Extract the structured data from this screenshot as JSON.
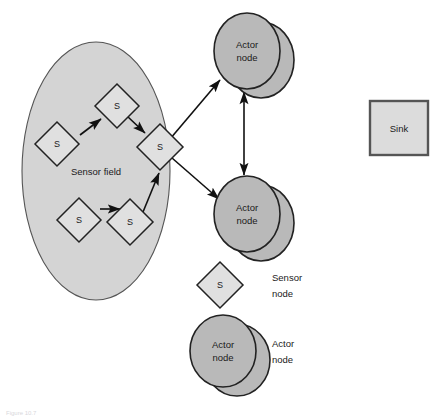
{
  "figure": {
    "caption": "Figure 10.7",
    "background_color": "#ffffff"
  },
  "colors": {
    "sensor_field_fill": "#d4d4d4",
    "sensor_field_stroke": "#555555",
    "actor_fill": "#b9b9b9",
    "actor_stroke": "#222222",
    "sensor_fill": "#e0e0e0",
    "sensor_stroke": "#222222",
    "sink_fill": "#dcdcdc",
    "sink_stroke": "#555555",
    "link_color": "#111111",
    "text_color": "#1a1a1a"
  },
  "sensor_field": {
    "label": "Sensor field",
    "label_x": 96,
    "label_y": 172,
    "cx": 96,
    "cy": 171,
    "rx": 74,
    "ry": 129
  },
  "sensor_nodes": [
    {
      "id": "s1",
      "label": "S",
      "x": 57,
      "y": 144,
      "half": 22
    },
    {
      "id": "s2",
      "label": "S",
      "x": 117,
      "y": 106,
      "half": 22
    },
    {
      "id": "s3",
      "label": "S",
      "x": 160,
      "y": 147,
      "half": 23
    },
    {
      "id": "s4",
      "label": "S",
      "x": 79,
      "y": 220,
      "half": 22
    },
    {
      "id": "s5",
      "label": "S",
      "x": 130,
      "y": 222,
      "half": 23
    }
  ],
  "actor_nodes": [
    {
      "id": "a1",
      "label_line1": "Actor",
      "label_line2": "node",
      "cx": 247,
      "cy": 51,
      "rx": 33,
      "ry": 38,
      "shadow_dx": 14,
      "shadow_dy": 9
    },
    {
      "id": "a2",
      "label_line1": "Actor",
      "label_line2": "node",
      "cx": 247,
      "cy": 214,
      "rx": 33,
      "ry": 38,
      "shadow_dx": 14,
      "shadow_dy": 9
    }
  ],
  "sink": {
    "label": "Sink",
    "x": 370,
    "y": 101,
    "width": 58,
    "height": 54
  },
  "links": [
    {
      "id": "s1-s2",
      "from": "s1",
      "to": "s2",
      "x1": 80,
      "y1": 135,
      "x2": 101,
      "y2": 119,
      "arrow_end": true,
      "arrow_start": false
    },
    {
      "id": "s2-s3",
      "from": "s2",
      "to": "s3",
      "x1": 127,
      "y1": 116,
      "x2": 145,
      "y2": 133,
      "arrow_end": true,
      "arrow_start": false
    },
    {
      "id": "s4-s5",
      "from": "s4",
      "to": "s5",
      "x1": 100,
      "y1": 209,
      "x2": 120,
      "y2": 209,
      "arrow_end": true,
      "arrow_start": false
    },
    {
      "id": "s5-s3",
      "from": "s5",
      "to": "s3",
      "x1": 143,
      "y1": 212,
      "x2": 159,
      "y2": 173,
      "arrow_end": true,
      "arrow_start": false
    },
    {
      "id": "s3-a1",
      "from": "s3",
      "to": "a1",
      "x1": 170,
      "y1": 139,
      "x2": 220,
      "y2": 80,
      "arrow_end": true,
      "arrow_start": false
    },
    {
      "id": "s3-a2",
      "from": "s3",
      "to": "a2",
      "x1": 172,
      "y1": 158,
      "x2": 219,
      "y2": 199,
      "arrow_end": true,
      "arrow_start": false
    },
    {
      "id": "a1-a2",
      "from": "a1",
      "to": "a2",
      "x1": 244,
      "y1": 92,
      "x2": 244,
      "y2": 175,
      "arrow_end": true,
      "arrow_start": true
    }
  ],
  "legend": [
    {
      "id": "legend-sensor",
      "shape": "diamond",
      "symbol": "S",
      "label_line1": "Sensor",
      "label_line2": "node",
      "shape_x": 220,
      "shape_y": 285,
      "half": 23,
      "text_x": 272,
      "text_y": 278
    },
    {
      "id": "legend-actor",
      "shape": "double-ellipse",
      "label_line1": "Actor",
      "label_line2": "node",
      "shape_x": 223,
      "shape_y": 351,
      "rx": 33,
      "ry": 36,
      "shadow_dx": 14,
      "shadow_dy": 9,
      "text_x": 272,
      "text_y": 344
    }
  ]
}
